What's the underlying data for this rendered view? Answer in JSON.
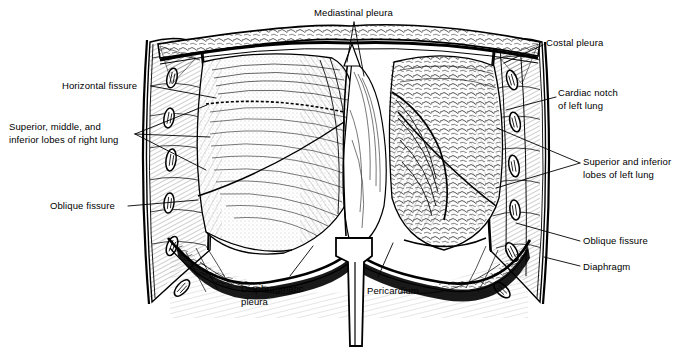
{
  "figure": {
    "kind": "anatomical-line-drawing",
    "style": "black-and-white pen-and-ink hatching",
    "background_color": "#ffffff",
    "ink_color": "#000000",
    "width": 685,
    "height": 350
  },
  "labels": [
    {
      "id": "mediastinal-pleura",
      "text": "Mediastinal pleura",
      "lines": [
        "Mediastinal pleura"
      ],
      "x": 314,
      "y": 7,
      "align": "left",
      "side": "top"
    },
    {
      "id": "costal-pleura",
      "text": "Costal pleura",
      "lines": [
        "Costal pleura"
      ],
      "x": 546,
      "y": 37,
      "align": "left",
      "side": "right"
    },
    {
      "id": "cardiac-notch",
      "text": "Cardiac notch of left lung",
      "lines": [
        "Cardiac notch",
        "of left lung"
      ],
      "x": 558,
      "y": 87,
      "align": "left",
      "side": "right"
    },
    {
      "id": "lobes-left-lung",
      "text": "Superior and inferior lobes of left lung",
      "lines": [
        "Superior and inferior",
        "lobes of left lung"
      ],
      "x": 583,
      "y": 156,
      "align": "left",
      "side": "right"
    },
    {
      "id": "oblique-fissure-right-side",
      "text": "Oblique fissure",
      "lines": [
        "Oblique fissure"
      ],
      "x": 583,
      "y": 235,
      "align": "left",
      "side": "right"
    },
    {
      "id": "diaphragm",
      "text": "Diaphragm",
      "lines": [
        "Diaphragm"
      ],
      "x": 583,
      "y": 261,
      "align": "left",
      "side": "right"
    },
    {
      "id": "horizontal-fissure",
      "text": "Horizontal fissure",
      "lines": [
        "Horizontal fissure"
      ],
      "x": 62,
      "y": 80,
      "align": "left",
      "side": "left"
    },
    {
      "id": "lobes-right-lung",
      "text": "Superior, middle, and inferior lobes of right lung",
      "lines": [
        "Superior, middle, and",
        "inferior lobes of right lung"
      ],
      "x": 9,
      "y": 121,
      "align": "left",
      "side": "left"
    },
    {
      "id": "oblique-fissure-left-side",
      "text": "Oblique fissure",
      "lines": [
        "Oblique fissure"
      ],
      "x": 50,
      "y": 200,
      "align": "left",
      "side": "left"
    },
    {
      "id": "diaphragmatic-pleura",
      "text": "Diaphragmatic pleura",
      "lines": [
        "Diaphragmatic",
        "pleura"
      ],
      "x": 241,
      "y": 283,
      "align": "left",
      "side": "bottom"
    },
    {
      "id": "pericardium",
      "text": "Pericardium",
      "lines": [
        "Pericardium"
      ],
      "x": 367,
      "y": 285,
      "align": "left",
      "side": "bottom"
    }
  ],
  "leaders": [
    {
      "id": "leader-mediastinal-pleura",
      "from": [
        354,
        22
      ],
      "to": [
        347,
        60
      ]
    },
    {
      "id": "leader-mediastinal-pleura-2",
      "from": [
        354,
        22
      ],
      "to": [
        362,
        72
      ]
    },
    {
      "id": "leader-costal-pleura",
      "from": [
        543,
        45
      ],
      "to": [
        505,
        62
      ]
    },
    {
      "id": "leader-cardiac-notch",
      "from": [
        556,
        97
      ],
      "to": [
        505,
        110
      ]
    },
    {
      "id": "leader-lobes-left-a",
      "from": [
        580,
        163
      ],
      "to": [
        498,
        130
      ]
    },
    {
      "id": "leader-lobes-left-b",
      "from": [
        580,
        163
      ],
      "to": [
        497,
        186
      ]
    },
    {
      "id": "leader-oblique-right",
      "from": [
        580,
        241
      ],
      "to": [
        520,
        225
      ]
    },
    {
      "id": "leader-diaphragm",
      "from": [
        580,
        266
      ],
      "to": [
        545,
        258
      ]
    },
    {
      "id": "leader-horizontal-fissure",
      "from": [
        151,
        86
      ],
      "to": [
        214,
        97
      ]
    },
    {
      "id": "leader-lobes-right-a",
      "from": [
        135,
        134
      ],
      "to": [
        205,
        107
      ]
    },
    {
      "id": "leader-lobes-right-b",
      "from": [
        135,
        134
      ],
      "to": [
        208,
        136
      ]
    },
    {
      "id": "leader-lobes-right-c",
      "from": [
        135,
        134
      ],
      "to": [
        205,
        168
      ]
    },
    {
      "id": "leader-oblique-left",
      "from": [
        128,
        206
      ],
      "to": [
        196,
        200
      ]
    },
    {
      "id": "leader-diaphragmatic-pleura",
      "from": [
        290,
        277
      ],
      "to": [
        312,
        248
      ]
    },
    {
      "id": "leader-pericardium",
      "from": [
        378,
        278
      ],
      "to": [
        392,
        245
      ]
    }
  ],
  "anatomy_parts": [
    {
      "id": "right-lung",
      "name": "Right lung (viewer left)",
      "lobes": [
        "superior",
        "middle",
        "inferior"
      ]
    },
    {
      "id": "left-lung",
      "name": "Left lung (viewer right)",
      "lobes": [
        "superior",
        "inferior"
      ]
    },
    {
      "id": "thoracic-wall",
      "name": "Thoracic wall with cut ribs and intercostal muscles"
    },
    {
      "id": "rib-sections",
      "name": "Cut rib cross-sections",
      "left_count": 6,
      "right_count": 6
    },
    {
      "id": "diaphragm-dome",
      "name": "Diaphragm"
    },
    {
      "id": "pericardium-stalk",
      "name": "Pericardium / central tendon stalk"
    },
    {
      "id": "mediastinum",
      "name": "Mediastinum between lungs"
    }
  ]
}
